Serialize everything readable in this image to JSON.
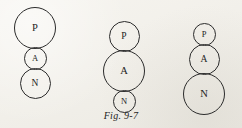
{
  "figure": {
    "caption": "Fig. 9-7",
    "background_color": "#f3f1ec",
    "stroke_color": "#2b2b2b",
    "text_color": "#1d1d1d"
  },
  "diagram_data": {
    "type": "diagram",
    "description": "Three vertical stacks of three tangent circles labeled P, A, N, each stack varying which circle is largest",
    "columns": [
      {
        "id": "col-1",
        "position": "left",
        "nodes": [
          {
            "label": "P",
            "size": "large"
          },
          {
            "label": "A",
            "size": "small"
          },
          {
            "label": "N",
            "size": "medium"
          }
        ]
      },
      {
        "id": "col-2",
        "position": "center",
        "nodes": [
          {
            "label": "P",
            "size": "medium"
          },
          {
            "label": "A",
            "size": "large"
          },
          {
            "label": "N",
            "size": "small"
          }
        ]
      },
      {
        "id": "col-3",
        "position": "right",
        "nodes": [
          {
            "label": "P",
            "size": "small"
          },
          {
            "label": "A",
            "size": "medium"
          },
          {
            "label": "N",
            "size": "large"
          }
        ]
      }
    ]
  }
}
